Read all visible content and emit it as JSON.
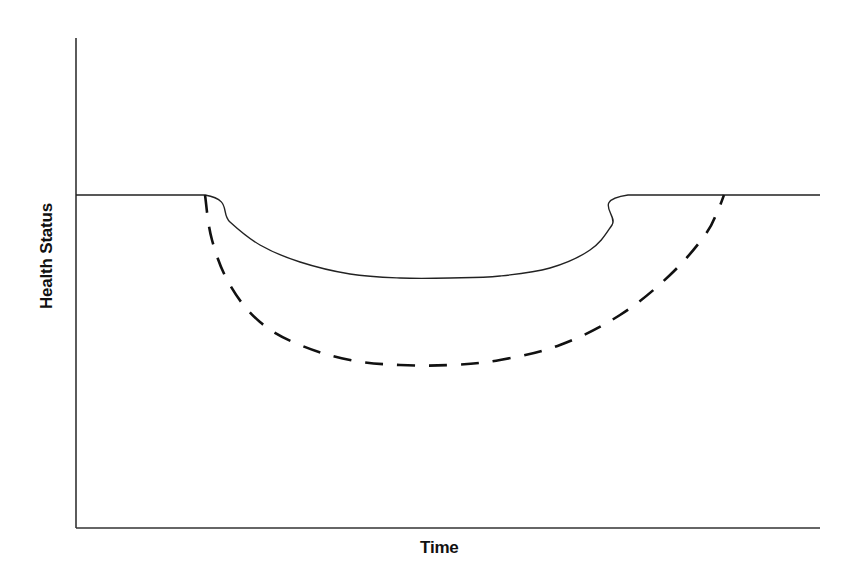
{
  "chart_data": {
    "type": "line",
    "title": "",
    "xlabel": "Time",
    "ylabel": "Health Status",
    "grid": false,
    "legend": null,
    "ticks": {
      "x": [],
      "y": []
    },
    "axis_ranges_px": {
      "origin": [
        76,
        528
      ],
      "x_end": 820,
      "y_top": 38
    },
    "baseline_level_px_from_xaxis": 333,
    "series": [
      {
        "name": "",
        "style": "solid",
        "description": "solid curve: flat baseline, sharp drop, shallow trough, then recovery back to baseline",
        "points_px": [
          [
            76,
            195
          ],
          [
            205,
            195
          ],
          [
            230,
            222
          ],
          [
            260,
            245
          ],
          [
            300,
            262
          ],
          [
            350,
            274
          ],
          [
            400,
            278
          ],
          [
            450,
            278
          ],
          [
            500,
            276
          ],
          [
            550,
            268
          ],
          [
            590,
            250
          ],
          [
            612,
            225
          ],
          [
            628,
            195
          ],
          [
            820,
            195
          ]
        ]
      },
      {
        "name": "",
        "style": "dashed",
        "description": "dashed curve: drops from baseline at same onset, deeper trough, slower recovery",
        "points_px": [
          [
            205,
            195
          ],
          [
            212,
            240
          ],
          [
            230,
            285
          ],
          [
            260,
            322
          ],
          [
            300,
            345
          ],
          [
            350,
            360
          ],
          [
            400,
            365
          ],
          [
            450,
            365
          ],
          [
            500,
            360
          ],
          [
            560,
            345
          ],
          [
            620,
            315
          ],
          [
            670,
            275
          ],
          [
            705,
            235
          ],
          [
            718,
            210
          ],
          [
            724,
            195
          ]
        ]
      }
    ]
  }
}
